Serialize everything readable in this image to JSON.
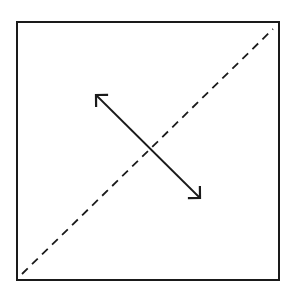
{
  "diagram": {
    "type": "geometric-figure",
    "colors": {
      "background": "#ffffff",
      "stroke": "#1a1a1a"
    },
    "square": {
      "x": 17,
      "y": 22,
      "width": 262,
      "height": 258,
      "stroke_width": 2
    },
    "dashed_diagonal": {
      "x1": 22,
      "y1": 274,
      "x2": 273,
      "y2": 29,
      "dash": "8 6",
      "stroke_width": 1.8
    },
    "double_arrow": {
      "x1": 96,
      "y1": 95,
      "x2": 200,
      "y2": 198,
      "stroke_width": 1.8,
      "head_length": 11
    }
  }
}
